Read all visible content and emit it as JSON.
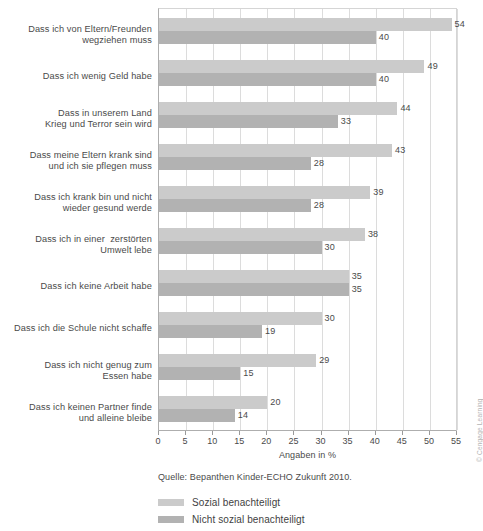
{
  "chart_data": {
    "type": "bar",
    "orientation": "horizontal",
    "title": "",
    "xlabel": "Angaben in %",
    "ylabel": "",
    "xlim": [
      0,
      55
    ],
    "xticks": [
      0,
      5,
      10,
      15,
      20,
      25,
      30,
      35,
      40,
      45,
      50,
      55
    ],
    "grid": "vertical",
    "legend_position": "bottom-left",
    "categories": [
      "Dass ich von Eltern/Freunden\nwegziehen muss",
      "Dass ich wenig Geld habe",
      "Dass in unserem Land\nKrieg und Terror sein wird",
      "Dass meine Eltern krank sind\nund ich sie pflegen muss",
      "Dass ich krank bin und nicht\nwieder gesund werde",
      "Dass ich in einer  zerstörten\nUmwelt lebe",
      "Dass ich keine Arbeit habe",
      "Dass ich die Schule nicht schaffe",
      "Dass ich nicht genug zum\nEssen habe",
      "Dass ich keinen Partner finde\nund alleine bleibe"
    ],
    "series": [
      {
        "name": "Sozial benachteiligt",
        "color": "#cbcbcb",
        "values": [
          54,
          49,
          44,
          43,
          39,
          38,
          35,
          30,
          29,
          20
        ]
      },
      {
        "name": "Nicht sozial benachteiligt",
        "color": "#b2b2b2",
        "values": [
          40,
          40,
          33,
          28,
          28,
          30,
          35,
          19,
          15,
          14
        ]
      }
    ],
    "source": "Quelle: Bepanthen Kinder-ECHO Zukunft 2010.",
    "credit": "© Cengage Learning"
  }
}
